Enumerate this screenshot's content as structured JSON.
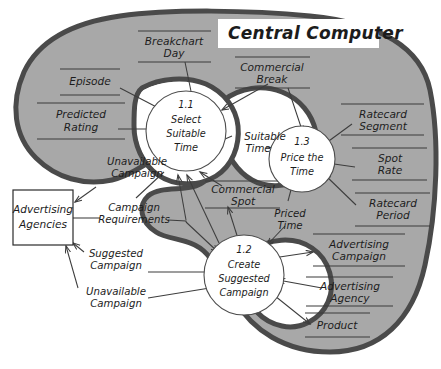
{
  "diagram": {
    "type": "data-flow-diagram",
    "title": "Central Computer",
    "system_boundary_label": "Central Computer"
  },
  "processes": [
    {
      "id": "1.1",
      "line1": "Select",
      "line2": "Suitable",
      "line3": "Time"
    },
    {
      "id": "1.3",
      "line1": "Price the",
      "line2": "Time",
      "line3": ""
    },
    {
      "id": "1.2",
      "line1": "Create",
      "line2": "Suggested",
      "line3": "Campaign"
    }
  ],
  "external_entities": [
    {
      "id": "advertising-agencies",
      "line1": "Advertising",
      "line2": "Agencies"
    }
  ],
  "data_stores": [
    {
      "id": "breakchart-day",
      "line1": "Breakchart",
      "line2": "Day"
    },
    {
      "id": "episode",
      "line1": "Episode",
      "line2": ""
    },
    {
      "id": "predicted-rating",
      "line1": "Predicted",
      "line2": "Rating"
    },
    {
      "id": "commercial-break",
      "line1": "Commercial",
      "line2": "Break"
    },
    {
      "id": "ratecard-segment",
      "line1": "Ratecard",
      "line2": "Segment"
    },
    {
      "id": "spot-rate",
      "line1": "Spot",
      "line2": "Rate"
    },
    {
      "id": "ratecard-period",
      "line1": "Ratecard",
      "line2": "Period"
    },
    {
      "id": "commercial-spot",
      "line1": "Commercial",
      "line2": "Spot"
    },
    {
      "id": "advertising-campaign",
      "line1": "Advertising",
      "line2": "Campaign"
    },
    {
      "id": "advertising-agency",
      "line1": "Advertising",
      "line2": "Agency"
    },
    {
      "id": "product",
      "line1": "Product",
      "line2": ""
    }
  ],
  "data_flows": [
    {
      "id": "suitable-time",
      "line1": "Suitable",
      "line2": "Time"
    },
    {
      "id": "priced-time",
      "line1": "Priced",
      "line2": "Time"
    },
    {
      "id": "unavailable-campaign-1",
      "line1": "Unavailable",
      "line2": "Campaign"
    },
    {
      "id": "campaign-requirements",
      "line1": "Campaign",
      "line2": "Requirements"
    },
    {
      "id": "suggested-campaign",
      "line1": "Suggested",
      "line2": "Campaign"
    },
    {
      "id": "unavailable-campaign-2",
      "line1": "Unavailable",
      "line2": "Campaign"
    }
  ],
  "colors": {
    "boundary_fill": "#a8a8a8",
    "boundary_stroke": "#4a4a4a",
    "process_fill": "#ffffff",
    "line": "#3d3d3d",
    "text": "#1c1c1c",
    "page_background": "#ffffff"
  }
}
